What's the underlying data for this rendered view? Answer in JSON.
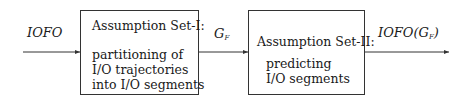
{
  "diagram": {
    "input_label": "IOFO",
    "box1": {
      "title": "Assumption Set-I:",
      "lines": [
        "partitioning of",
        "I/O trajectories",
        "into I/O segments"
      ]
    },
    "middle_label": {
      "main": "G",
      "sub": "F"
    },
    "box2": {
      "title": "Assumption Set-II:",
      "lines": [
        "predicting",
        "I/O segments"
      ]
    },
    "output_label": {
      "prefix": "IOFO(",
      "main": "G",
      "sub": "F",
      "suffix": ")"
    },
    "arrows": [
      {
        "from": "input",
        "to": "box1"
      },
      {
        "from": "box1",
        "to": "box2"
      },
      {
        "from": "box2",
        "to": "output"
      }
    ]
  }
}
